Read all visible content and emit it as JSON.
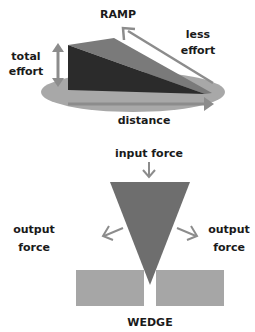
{
  "ramp": {
    "title": "RAMP",
    "total_effort_line1": "total",
    "total_effort_line2": "effort",
    "less_effort_line1": "less",
    "less_effort_line2": "effort",
    "distance": "distance"
  },
  "wedge": {
    "title": "WEDGE",
    "input_force": "input force",
    "output_left_line1": "output",
    "output_left_line2": "force",
    "output_right_line1": "output",
    "output_right_line2": "force"
  },
  "colors": {
    "ellipse": "#a8a8a8",
    "ramp_side": "#2b2b2b",
    "ramp_top": "#7a7a7a",
    "arrow": "#8c8c8c",
    "wedge": "#6e6e6e",
    "block": "#a6a6a6"
  }
}
